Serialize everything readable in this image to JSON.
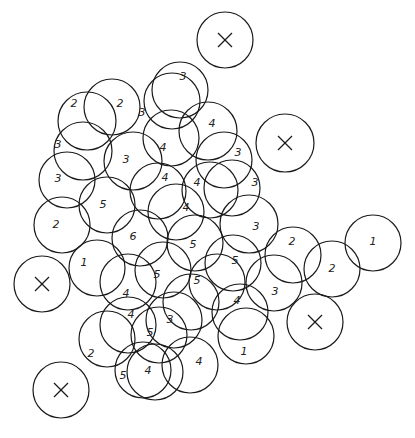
{
  "diagram": {
    "stroke_color": "#1a1a1a",
    "background": "#ffffff",
    "radius": 28,
    "circles": [
      {
        "x": 225,
        "y": 40,
        "r": 28,
        "label": "X"
      },
      {
        "x": 285,
        "y": 143,
        "r": 29,
        "label": "X"
      },
      {
        "x": 42,
        "y": 284,
        "r": 28,
        "label": "X"
      },
      {
        "x": 315,
        "y": 322,
        "r": 28,
        "label": "X"
      },
      {
        "x": 61,
        "y": 390,
        "r": 28,
        "label": "X"
      },
      {
        "x": 87,
        "y": 121,
        "r": 29,
        "label": "2"
      },
      {
        "x": 112,
        "y": 107,
        "r": 28,
        "label": "2"
      },
      {
        "x": 172,
        "y": 101,
        "r": 28,
        "label": "3"
      },
      {
        "x": 180,
        "y": 90,
        "r": 28,
        "label": ""
      },
      {
        "x": 83,
        "y": 151,
        "r": 29,
        "label": "3"
      },
      {
        "x": 67,
        "y": 180,
        "r": 28,
        "label": "3"
      },
      {
        "x": 171,
        "y": 138,
        "r": 28,
        "label": "4"
      },
      {
        "x": 208,
        "y": 131,
        "r": 29,
        "label": "4"
      },
      {
        "x": 133,
        "y": 161,
        "r": 29,
        "label": "3"
      },
      {
        "x": 62,
        "y": 225,
        "r": 28,
        "label": "2"
      },
      {
        "x": 107,
        "y": 205,
        "r": 28,
        "label": "5"
      },
      {
        "x": 158,
        "y": 191,
        "r": 28,
        "label": "4"
      },
      {
        "x": 224,
        "y": 160,
        "r": 28,
        "label": "3"
      },
      {
        "x": 210,
        "y": 190,
        "r": 28,
        "label": "4"
      },
      {
        "x": 232,
        "y": 188,
        "r": 28,
        "label": "3"
      },
      {
        "x": 176,
        "y": 212,
        "r": 28,
        "label": "4"
      },
      {
        "x": 249,
        "y": 224,
        "r": 29,
        "label": "3"
      },
      {
        "x": 140,
        "y": 238,
        "r": 28,
        "label": "6"
      },
      {
        "x": 195,
        "y": 243,
        "r": 28,
        "label": "5"
      },
      {
        "x": 97,
        "y": 268,
        "r": 28,
        "label": "1"
      },
      {
        "x": 128,
        "y": 282,
        "r": 28,
        "label": "4"
      },
      {
        "x": 163,
        "y": 270,
        "r": 28,
        "label": "5"
      },
      {
        "x": 217,
        "y": 282,
        "r": 28,
        "label": "5"
      },
      {
        "x": 233,
        "y": 263,
        "r": 28,
        "label": "5"
      },
      {
        "x": 293,
        "y": 255,
        "r": 28,
        "label": "2"
      },
      {
        "x": 332,
        "y": 269,
        "r": 28,
        "label": "2"
      },
      {
        "x": 373,
        "y": 243,
        "r": 28,
        "label": "1"
      },
      {
        "x": 274,
        "y": 283,
        "r": 28,
        "label": "3"
      },
      {
        "x": 240,
        "y": 312,
        "r": 28,
        "label": "4"
      },
      {
        "x": 246,
        "y": 336,
        "r": 28,
        "label": "1"
      },
      {
        "x": 191,
        "y": 302,
        "r": 28,
        "label": ""
      },
      {
        "x": 174,
        "y": 320,
        "r": 28,
        "label": "3"
      },
      {
        "x": 159,
        "y": 335,
        "r": 28,
        "label": "5"
      },
      {
        "x": 128,
        "y": 325,
        "r": 28,
        "label": "4"
      },
      {
        "x": 107,
        "y": 339,
        "r": 28,
        "label": "2"
      },
      {
        "x": 143,
        "y": 370,
        "r": 28,
        "label": "5"
      },
      {
        "x": 155,
        "y": 372,
        "r": 28,
        "label": "4"
      },
      {
        "x": 190,
        "y": 365,
        "r": 28,
        "label": "4"
      },
      {
        "x": 115,
        "y": 280,
        "r": 1,
        "label": ""
      }
    ],
    "labels": [
      {
        "x": 74,
        "y": 107,
        "text": "2"
      },
      {
        "x": 120,
        "y": 107,
        "text": "2"
      },
      {
        "x": 142,
        "y": 116,
        "text": "3"
      },
      {
        "x": 183,
        "y": 80,
        "text": "3"
      },
      {
        "x": 58,
        "y": 148,
        "text": "3"
      },
      {
        "x": 58,
        "y": 182,
        "text": "3"
      },
      {
        "x": 163,
        "y": 151,
        "text": "4"
      },
      {
        "x": 212,
        "y": 127,
        "text": "4"
      },
      {
        "x": 126,
        "y": 163,
        "text": "3"
      },
      {
        "x": 56,
        "y": 228,
        "text": "2"
      },
      {
        "x": 103,
        "y": 208,
        "text": "5"
      },
      {
        "x": 165,
        "y": 181,
        "text": "4"
      },
      {
        "x": 238,
        "y": 156,
        "text": "3"
      },
      {
        "x": 197,
        "y": 186,
        "text": "4"
      },
      {
        "x": 255,
        "y": 186,
        "text": "3"
      },
      {
        "x": 186,
        "y": 211,
        "text": "4"
      },
      {
        "x": 256,
        "y": 230,
        "text": "3"
      },
      {
        "x": 133,
        "y": 240,
        "text": "6"
      },
      {
        "x": 193,
        "y": 248,
        "text": "5"
      },
      {
        "x": 84,
        "y": 266,
        "text": "1"
      },
      {
        "x": 126,
        "y": 297,
        "text": "4"
      },
      {
        "x": 157,
        "y": 278,
        "text": "5"
      },
      {
        "x": 197,
        "y": 284,
        "text": "5"
      },
      {
        "x": 235,
        "y": 264,
        "text": "5"
      },
      {
        "x": 292,
        "y": 245,
        "text": "2"
      },
      {
        "x": 332,
        "y": 272,
        "text": "2"
      },
      {
        "x": 373,
        "y": 245,
        "text": "1"
      },
      {
        "x": 275,
        "y": 295,
        "text": "3"
      },
      {
        "x": 237,
        "y": 304,
        "text": "4"
      },
      {
        "x": 244,
        "y": 355,
        "text": "1"
      },
      {
        "x": 170,
        "y": 323,
        "text": "3"
      },
      {
        "x": 150,
        "y": 336,
        "text": "5"
      },
      {
        "x": 131,
        "y": 318,
        "text": "4"
      },
      {
        "x": 91,
        "y": 357,
        "text": "2"
      },
      {
        "x": 123,
        "y": 379,
        "text": "5"
      },
      {
        "x": 148,
        "y": 374,
        "text": "4"
      },
      {
        "x": 199,
        "y": 365,
        "text": "4"
      }
    ]
  }
}
